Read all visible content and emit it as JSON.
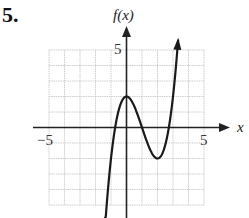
{
  "problem": {
    "number": "5."
  },
  "chart_data": {
    "type": "line",
    "title": "",
    "xlabel": "x",
    "ylabel": "f(x)",
    "xlim": [
      -5,
      5
    ],
    "ylim": [
      -5,
      5
    ],
    "grid": true,
    "grid_step": 1,
    "tick_labels": {
      "x": [
        "-5",
        "5"
      ],
      "y": [
        "5"
      ]
    },
    "series": [
      {
        "name": "f(x)",
        "description": "cubic with local max at (0, 2) and local min at (2, -2); consistent with x^3 - 3x^2 + 2",
        "x": [
          -1.3,
          -1,
          -0.73,
          -0.5,
          0,
          0.5,
          1,
          1.5,
          2,
          2.5,
          2.73,
          3,
          3.35
        ],
        "y": [
          -5.27,
          -2,
          0,
          1.13,
          2,
          1.38,
          0,
          -1.38,
          -2,
          -1.13,
          0,
          2,
          5.97
        ],
        "key_points": {
          "local_max": [
            0,
            2
          ],
          "local_min": [
            2,
            -2
          ],
          "zeros": [
            -0.73,
            1,
            2.73
          ]
        },
        "arrows": "both ends continue beyond the grid (down on left, up on right)"
      }
    ]
  },
  "labels": {
    "x_axis": "x",
    "y_axis": "f(x)",
    "x_min": "−5",
    "x_max": "5",
    "y_max": "5"
  },
  "colors": {
    "grid": "#c8c8c8",
    "axis": "#222222",
    "curve": "#1a1a1a"
  }
}
